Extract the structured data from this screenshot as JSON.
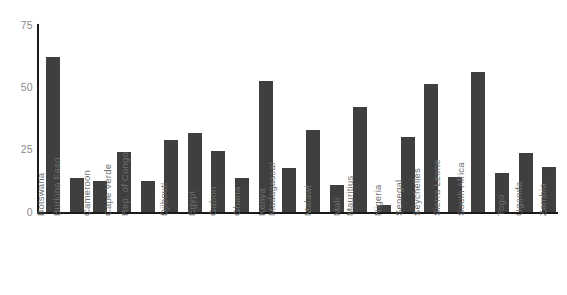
{
  "chart_data": {
    "type": "bar",
    "title": "",
    "subtitle": "",
    "xlabel": "",
    "ylabel": "",
    "ylim": [
      0,
      75
    ],
    "yticks": [
      0,
      25,
      50,
      75
    ],
    "grid": false,
    "legend": null,
    "bar_color": "#3f3f3f",
    "axis_color": "#1a1a1a",
    "tick_label_color": "#8a8a8a",
    "category_label_color": "#6e6e6e",
    "category_label_rotation": -90,
    "categories": [
      "Botswana",
      "Burkina Faso",
      "Cameroon",
      "Cape Verde",
      "Rep. of Congo",
      "Djibouti",
      "Egypt",
      "Gabon",
      "Ghana",
      "Kenya",
      "Madagascar",
      "Malawi",
      "Mali",
      "Mauritius",
      "Nigeria",
      "Senegal",
      "Seychelles",
      "Sierra Leone",
      "South Africa",
      "Togo",
      "Uganda",
      "Zambia"
    ],
    "values": [
      62,
      13.5,
      12.5,
      24,
      12.5,
      29,
      31.5,
      24.5,
      13.5,
      52.5,
      17.5,
      33,
      11,
      42,
      3,
      30,
      51.5,
      14,
      56,
      15.5,
      23.5,
      18
    ]
  }
}
